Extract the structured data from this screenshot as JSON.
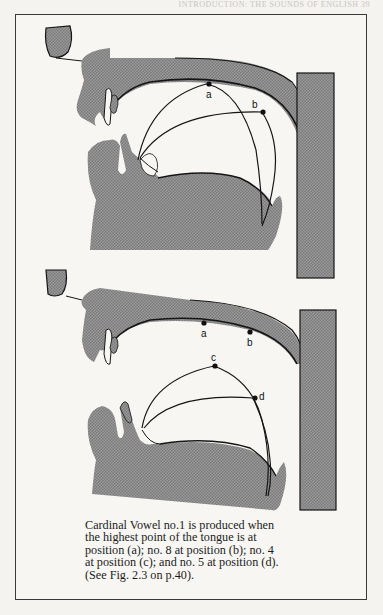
{
  "page": {
    "running_header": "INTRODUCTION: THE SOUNDS OF ENGLISH   39"
  },
  "figure": {
    "top_diagram": {
      "points": [
        {
          "label": "a"
        },
        {
          "label": "b"
        }
      ]
    },
    "bottom_diagram": {
      "points": [
        {
          "label": "a"
        },
        {
          "label": "b"
        },
        {
          "label": "c"
        },
        {
          "label": "d"
        }
      ]
    },
    "colors": {
      "tissue": "#8c8c8c",
      "outline": "#151515",
      "frame": "#3a3a3a"
    },
    "caption": [
      "Cardinal Vowel no.1 is produced when",
      "the highest point of the tongue is at",
      "position (a); no. 8 at position (b); no. 4",
      "at position (c); and no. 5 at position (d).",
      "(See Fig. 2.3 on p.40)."
    ]
  }
}
